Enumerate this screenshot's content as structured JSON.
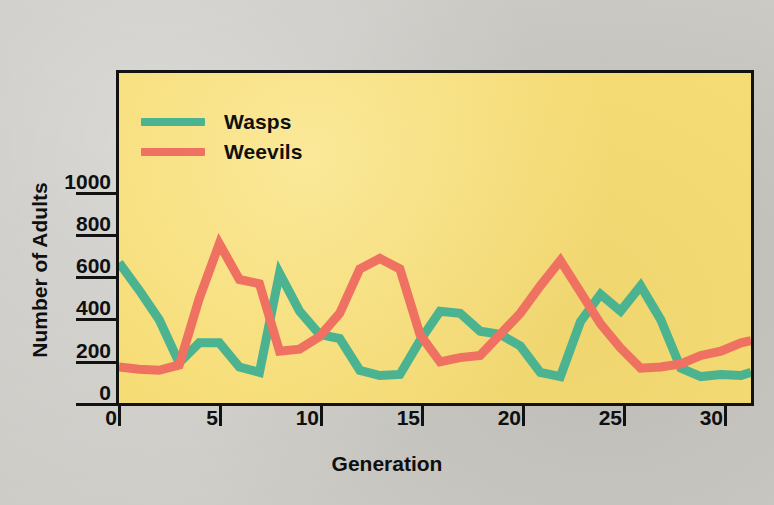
{
  "figure": {
    "background_color": "#c9c8c3",
    "plot_background_color": "#f6dc74",
    "frame_color": "#121212"
  },
  "legend": {
    "position": "top-left-inside",
    "entries": [
      {
        "label": "Wasps",
        "color": "#4cb391",
        "swatch_name": "wasps-swatch"
      },
      {
        "label": "Weevils",
        "color": "#ef7161",
        "swatch_name": "weevils-swatch"
      }
    ]
  },
  "y_axis": {
    "title": "Number of Adults",
    "ticks": [
      "0",
      "200",
      "400",
      "600",
      "800",
      "1000"
    ]
  },
  "x_axis": {
    "title": "Generation",
    "ticks": [
      "0",
      "5",
      "10",
      "15",
      "20",
      "25",
      "30"
    ]
  },
  "chart_data": {
    "type": "line",
    "title": "",
    "subtitle": "",
    "xlabel": "Generation",
    "ylabel": "Number of Adults",
    "xlim": [
      0,
      31.5
    ],
    "ylim": [
      0,
      1100
    ],
    "xticks": [
      0,
      5,
      10,
      15,
      20,
      25,
      30
    ],
    "yticks": [
      0,
      200,
      400,
      600,
      800,
      1000
    ],
    "grid": false,
    "legend_position": "upper left",
    "x": [
      0,
      1,
      2,
      3,
      4,
      5,
      6,
      7,
      8,
      9,
      10,
      11,
      12,
      13,
      14,
      15,
      16,
      17,
      18,
      19,
      20,
      21,
      22,
      23,
      24,
      25,
      26,
      27,
      28,
      29,
      30,
      31,
      31.5
    ],
    "series": [
      {
        "name": "Wasps",
        "color": "#4cb391",
        "values": [
          670,
          540,
          400,
          195,
          290,
          290,
          175,
          150,
          620,
          440,
          330,
          310,
          160,
          135,
          140,
          300,
          440,
          430,
          345,
          330,
          275,
          150,
          130,
          390,
          520,
          440,
          560,
          400,
          170,
          130,
          140,
          135,
          150
        ]
      },
      {
        "name": "Weevils",
        "color": "#ef7161",
        "values": [
          175,
          165,
          160,
          185,
          500,
          760,
          590,
          570,
          250,
          260,
          320,
          430,
          640,
          690,
          640,
          330,
          200,
          220,
          230,
          330,
          430,
          560,
          680,
          530,
          380,
          265,
          170,
          175,
          190,
          230,
          250,
          290,
          300
        ]
      }
    ],
    "series_detailed": {
      "Wasps": [
        {
          "gen": 0,
          "value": 670
        },
        {
          "gen": 1,
          "value": 540
        },
        {
          "gen": 2,
          "value": 400
        },
        {
          "gen": 3,
          "value": 195
        },
        {
          "gen": 4,
          "value": 290
        },
        {
          "gen": 5,
          "value": 290
        },
        {
          "gen": 6,
          "value": 175
        },
        {
          "gen": 7,
          "value": 150
        },
        {
          "gen": 8,
          "value": 620
        },
        {
          "gen": 9,
          "value": 440
        },
        {
          "gen": 10,
          "value": 330
        },
        {
          "gen": 11,
          "value": 310
        },
        {
          "gen": 12,
          "value": 160
        },
        {
          "gen": 13,
          "value": 135
        },
        {
          "gen": 14,
          "value": 140
        },
        {
          "gen": 15,
          "value": 300
        },
        {
          "gen": 16,
          "value": 440
        },
        {
          "gen": 17,
          "value": 430
        },
        {
          "gen": 18,
          "value": 345
        },
        {
          "gen": 19,
          "value": 330
        },
        {
          "gen": 20,
          "value": 275
        },
        {
          "gen": 21,
          "value": 150
        },
        {
          "gen": 22,
          "value": 130
        },
        {
          "gen": 23,
          "value": 390
        },
        {
          "gen": 24,
          "value": 520
        },
        {
          "gen": 25,
          "value": 440
        },
        {
          "gen": 26,
          "value": 560
        },
        {
          "gen": 27,
          "value": 400
        },
        {
          "gen": 28,
          "value": 170
        },
        {
          "gen": 29,
          "value": 130
        },
        {
          "gen": 30,
          "value": 140
        },
        {
          "gen": 31,
          "value": 135
        },
        {
          "gen": 31.5,
          "value": 150
        }
      ],
      "Weevils": [
        {
          "gen": 0,
          "value": 175
        },
        {
          "gen": 1,
          "value": 165
        },
        {
          "gen": 2,
          "value": 160
        },
        {
          "gen": 3,
          "value": 185
        },
        {
          "gen": 4,
          "value": 500
        },
        {
          "gen": 5,
          "value": 760
        },
        {
          "gen": 6,
          "value": 590
        },
        {
          "gen": 7,
          "value": 570
        },
        {
          "gen": 8,
          "value": 250
        },
        {
          "gen": 9,
          "value": 260
        },
        {
          "gen": 10,
          "value": 320
        },
        {
          "gen": 11,
          "value": 430
        },
        {
          "gen": 12,
          "value": 640
        },
        {
          "gen": 13,
          "value": 690
        },
        {
          "gen": 14,
          "value": 640
        },
        {
          "gen": 15,
          "value": 330
        },
        {
          "gen": 16,
          "value": 200
        },
        {
          "gen": 17,
          "value": 220
        },
        {
          "gen": 18,
          "value": 230
        },
        {
          "gen": 19,
          "value": 330
        },
        {
          "gen": 20,
          "value": 430
        },
        {
          "gen": 21,
          "value": 560
        },
        {
          "gen": 22,
          "value": 680
        },
        {
          "gen": 23,
          "value": 530
        },
        {
          "gen": 24,
          "value": 380
        },
        {
          "gen": 25,
          "value": 265
        },
        {
          "gen": 26,
          "value": 170
        },
        {
          "gen": 27,
          "value": 175
        },
        {
          "gen": 28,
          "value": 190
        },
        {
          "gen": 29,
          "value": 230
        },
        {
          "gen": 30,
          "value": 250
        },
        {
          "gen": 31,
          "value": 290
        },
        {
          "gen": 31.5,
          "value": 300
        }
      ]
    }
  },
  "_render_geometry": {
    "plot_left_px": 116,
    "plot_top_px": 70,
    "plot_width_px": 638,
    "plot_height_px": 336,
    "x_min": 0,
    "x_max": 31.5,
    "y_value_at_plot_bottom": 0,
    "y_pixels_per_unit_ref": {
      "y0_px_from_top": 334,
      "y1000_px_from_top": 123
    }
  }
}
